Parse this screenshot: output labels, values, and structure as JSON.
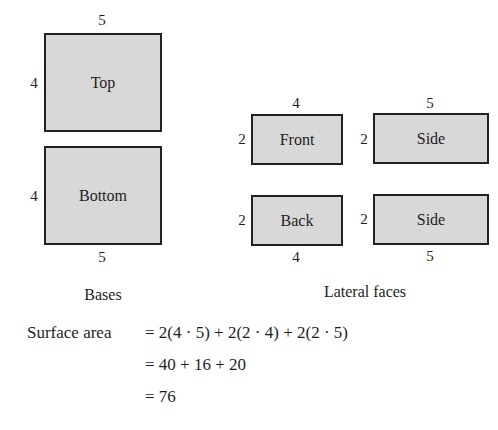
{
  "bases": {
    "caption": "Bases",
    "top": {
      "label": "Top",
      "width_label": "5",
      "height_label": "4"
    },
    "bottom": {
      "label": "Bottom",
      "width_label": "5",
      "height_label": "4"
    }
  },
  "lateral": {
    "caption": "Lateral faces",
    "front": {
      "label": "Front",
      "width_label": "4",
      "height_label": "2"
    },
    "side_top": {
      "label": "Side",
      "width_label": "5",
      "height_label": "2"
    },
    "back": {
      "label": "Back",
      "width_label": "4",
      "height_label": "2"
    },
    "side_bottom": {
      "label": "Side",
      "width_label": "5",
      "height_label": "2"
    }
  },
  "equation": {
    "lhs": "Surface area",
    "lines": [
      "= 2(4 · 5) + 2(2 · 4) + 2(2 · 5)",
      "= 40 + 16 + 20",
      "= 76"
    ]
  },
  "colors": {
    "face_fill": "#d8d8d8",
    "face_border": "#222222"
  }
}
